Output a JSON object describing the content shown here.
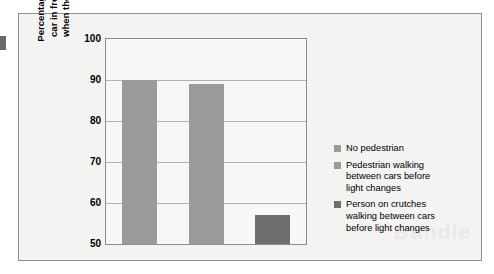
{
  "chart_data": {
    "type": "bar",
    "title": "",
    "xlabel": "",
    "ylabel": "Percentage of cars that honk when\ncar in front fails to move forward\nwhen the traffic light turns green",
    "categories": [
      "No pedestrian",
      "Pedestrian walking between cars before light changes",
      "Person on crutches walking between cars before light changes"
    ],
    "values": [
      90,
      89,
      57
    ],
    "ylim": [
      50,
      100
    ],
    "yticks": [
      100,
      90,
      80,
      70,
      60,
      50
    ],
    "ytick_labels": [
      "100",
      "90",
      "80",
      "70",
      "60",
      "50"
    ],
    "grid": true,
    "legend_position": "right",
    "series": [
      {
        "name": "No pedestrian",
        "value": 90,
        "color": "#9a9a9a"
      },
      {
        "name": "Pedestrian walking between cars before light changes",
        "value": 89,
        "color": "#9a9a9a"
      },
      {
        "name": "Person on crutches walking between cars before light changes",
        "value": 57,
        "color": "#6e6e6e"
      }
    ]
  },
  "axis": {
    "y_title": "Percentage of cars that honk when\ncar in front fails to move forward\nwhen the traffic light turns green",
    "tick_100": "100",
    "tick_90": "90",
    "tick_80": "80",
    "tick_70": "70",
    "tick_60": "60",
    "tick_50": "50"
  },
  "legend": {
    "items": [
      {
        "label": "No pedestrian",
        "color": "#9a9a9a"
      },
      {
        "label": "Pedestrian walking\nbetween cars before\nlight changes",
        "color": "#9a9a9a"
      },
      {
        "label": "Person on crutches\nwalking between cars\nbefore light changes",
        "color": "#6e6e6e"
      }
    ]
  },
  "watermark": {
    "text": "Bundle"
  },
  "colors": {
    "bar_light": "#9a9a9a",
    "bar_dark": "#6e6e6e",
    "frame": "#8f9194",
    "panel_bg": "#f3f3f1",
    "plot_bg": "#f7f7f5",
    "gridline": "#b0b2b4"
  }
}
